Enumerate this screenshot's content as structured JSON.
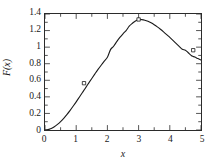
{
  "chart_data": {
    "type": "line",
    "title": "",
    "xlabel": "x",
    "ylabel": "F(x)",
    "xlim": [
      0,
      5
    ],
    "ylim": [
      0,
      1.4
    ],
    "grid": false,
    "legend": null,
    "xticks": [
      0,
      1,
      2,
      3,
      4,
      5
    ],
    "xtick_labels": [
      "0",
      "1",
      "2",
      "3",
      "4",
      "5"
    ],
    "xminor_step": 0.5,
    "yticks": [
      0,
      0.2,
      0.4,
      0.6,
      0.8,
      1,
      1.2,
      1.4
    ],
    "ytick_labels": [
      "0",
      "0.2",
      "0.4",
      "0.6",
      "0.8",
      "1",
      "1.2",
      "1.4"
    ],
    "yminor_step": 0.1,
    "line_color": "#1a1a1a",
    "marker_color": "#1a1a1a",
    "marker_style": "square-open",
    "series": [
      {
        "name": "F(x)",
        "x": [
          0.0,
          0.1,
          0.2,
          0.3,
          0.4,
          0.5,
          0.6,
          0.7,
          0.8,
          0.9,
          1.0,
          1.1,
          1.2,
          1.25,
          1.3,
          1.4,
          1.5,
          1.6,
          1.7,
          1.8,
          1.9,
          2.0,
          2.1,
          2.2,
          2.3,
          2.4,
          2.5,
          2.6,
          2.7,
          2.8,
          2.9,
          3.0,
          3.1,
          3.2,
          3.3,
          3.4,
          3.5,
          3.6,
          3.7,
          3.8,
          3.9,
          4.0,
          4.1,
          4.2,
          4.3,
          4.4,
          4.5,
          4.6,
          4.7,
          4.75,
          4.8,
          4.9,
          5.0
        ],
        "y": [
          0.0,
          0.005,
          0.018,
          0.039,
          0.067,
          0.101,
          0.141,
          0.186,
          0.234,
          0.286,
          0.34,
          0.396,
          0.452,
          0.481,
          0.509,
          0.566,
          0.622,
          0.677,
          0.731,
          0.782,
          0.831,
          0.877,
          0.97,
          1.011,
          1.067,
          1.117,
          1.161,
          1.2,
          1.253,
          1.288,
          1.316,
          1.334,
          1.332,
          1.325,
          1.312,
          1.294,
          1.271,
          1.245,
          1.216,
          1.185,
          1.152,
          1.117,
          1.082,
          1.046,
          1.01,
          0.974,
          0.963,
          0.929,
          0.896,
          0.888,
          0.88,
          0.862,
          0.845
        ]
      }
    ],
    "markers": [
      {
        "x": 1.25,
        "y": 0.565,
        "label": "data-point-1"
      },
      {
        "x": 3.0,
        "y": 1.334,
        "label": "data-point-2"
      },
      {
        "x": 4.75,
        "y": 0.963,
        "label": "data-point-3"
      }
    ]
  }
}
